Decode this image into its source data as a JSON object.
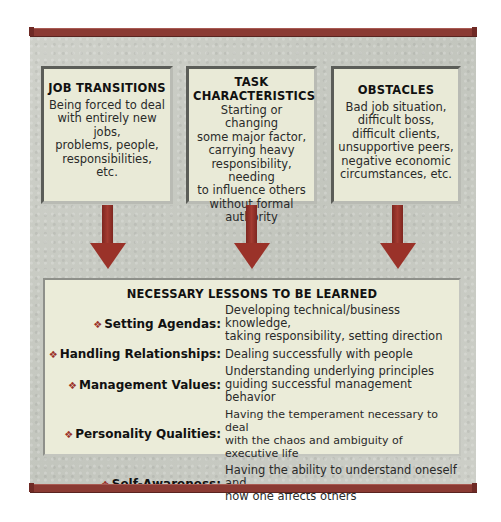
{
  "colors": {
    "accent_red": "#9a3229",
    "bar_red": "#8a3a33",
    "panel_bg": "#c9cbc4",
    "box_bg": "#e9ead7",
    "lessons_bg": "#ebecd9"
  },
  "sources": [
    {
      "title": "JOB TRANSITIONS",
      "lines": [
        "Being forced to deal",
        "with entirely new jobs,",
        "problems, people,",
        "responsibilities,",
        "etc."
      ]
    },
    {
      "title_lines": [
        "TASK",
        "CHARACTERISTICS"
      ],
      "lines": [
        "Starting or changing",
        "some major factor,",
        "carrying heavy",
        "responsibility, needing",
        "to influence others",
        "without formal",
        "authority"
      ]
    },
    {
      "title": "OBSTACLES",
      "lines": [
        "Bad job situation,",
        "difficult boss,",
        "difficult clients,",
        "unsupportive peers,",
        "negative economic",
        "circumstances, etc."
      ]
    }
  ],
  "arrows": [
    "down-arrow",
    "down-arrow",
    "down-arrow"
  ],
  "lessons": {
    "title": "NECESSARY LESSONS TO BE LEARNED",
    "bullet": "❖",
    "items": [
      {
        "term": "Setting Agendas:",
        "def_lines": [
          "Developing technical/business knowledge,",
          "taking responsibility, setting direction"
        ]
      },
      {
        "term": "Handling Relationships:",
        "def_lines": [
          "Dealing successfully with people"
        ]
      },
      {
        "term": "Management Values:",
        "def_lines": [
          "Understanding underlying principles",
          "guiding successful management behavior"
        ]
      },
      {
        "term": "Personality Qualities:",
        "def_lines": [
          "Having the temperament necessary to deal",
          "with the chaos and ambiguity of executive life"
        ]
      },
      {
        "term": "Self-Awareness:",
        "def_lines": [
          "Having the ability to understand oneself and",
          "how one affects others"
        ]
      }
    ]
  }
}
